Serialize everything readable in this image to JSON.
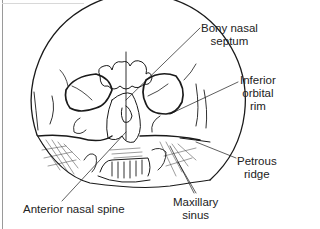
{
  "figure": {
    "type": "radiograph-line-drawing",
    "stroke_color": "#1a1a1a",
    "background": "#ffffff"
  },
  "labels": {
    "bony_nasal_septum": {
      "line1": "Bony nasal",
      "line2": "septum"
    },
    "inferior_orbital_rim": {
      "line1": "Inferior",
      "line2": "orbital",
      "line3": "rim"
    },
    "petrous_ridge": {
      "line1": "Petrous",
      "line2": "ridge"
    },
    "maxillary_sinus": {
      "line1": "Maxillary",
      "line2": "sinus"
    },
    "anterior_nasal_spine": {
      "line1": "Anterior nasal spine"
    }
  }
}
